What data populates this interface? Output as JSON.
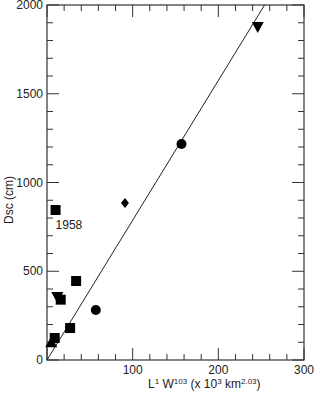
{
  "chart_data": {
    "type": "scatter",
    "title": "",
    "xlabel": "L¹ W¹·⁰³ (x10³ km²·⁰³)",
    "xlabel_parts": {
      "base1": "L",
      "sup1": "1",
      "base2": " W",
      "sup2": "103",
      "rest1": " (x 10",
      "sup3": "3",
      "rest2": " km",
      "sup4": "2.03",
      "rest3": ")"
    },
    "ylabel": "Dsc (cm)",
    "xlim": [
      0,
      300
    ],
    "ylim": [
      0,
      2000
    ],
    "x_ticks": [
      0,
      100,
      200,
      300
    ],
    "y_ticks": [
      0,
      500,
      1000,
      1500,
      2000
    ],
    "grid": false,
    "legend": null,
    "annotations": [
      {
        "text": "1958",
        "x": 10,
        "y": 760
      }
    ],
    "series": [
      {
        "name": "squares",
        "marker": "square",
        "points": [
          [
            9,
            124
          ],
          [
            27,
            180
          ],
          [
            16,
            340
          ],
          [
            34,
            445
          ],
          [
            10,
            845
          ]
        ]
      },
      {
        "name": "circles",
        "marker": "circle",
        "points": [
          [
            57,
            282
          ],
          [
            157,
            1217
          ]
        ]
      },
      {
        "name": "down-triangles",
        "marker": "triangle-down",
        "points": [
          [
            12,
            355
          ],
          [
            246,
            1876
          ]
        ]
      },
      {
        "name": "up-triangles",
        "marker": "triangle-up",
        "points": [
          [
            5,
            100
          ]
        ]
      },
      {
        "name": "diamonds",
        "marker": "diamond",
        "points": [
          [
            91,
            885
          ]
        ]
      }
    ],
    "fit_line": {
      "x": [
        0,
        254
      ],
      "y": [
        0,
        2000
      ]
    }
  }
}
